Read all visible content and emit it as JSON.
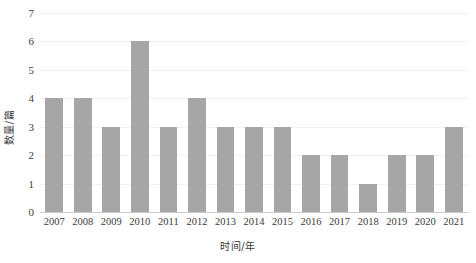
{
  "chart_data": {
    "type": "bar",
    "title": "",
    "xlabel": "时间/年",
    "ylabel": "数量/篇",
    "categories": [
      "2007",
      "2008",
      "2009",
      "2010",
      "2011",
      "2012",
      "2013",
      "2014",
      "2015",
      "2016",
      "2017",
      "2018",
      "2019",
      "2020",
      "2021"
    ],
    "values": [
      4,
      4,
      3,
      6,
      3,
      4,
      3,
      3,
      3,
      2,
      2,
      1,
      2,
      2,
      3
    ],
    "series": [
      {
        "name": "数量/篇",
        "values": [
          4,
          4,
          3,
          6,
          3,
          4,
          3,
          3,
          3,
          2,
          2,
          1,
          2,
          2,
          3
        ]
      }
    ],
    "ylim": [
      0,
      7
    ],
    "xlim_categories": 15,
    "y_ticks": [
      0,
      1,
      2,
      3,
      4,
      5,
      6,
      7
    ],
    "y_tick_labels": [
      "0",
      "1",
      "2",
      "3",
      "4",
      "5",
      "6",
      "7"
    ],
    "grid": true,
    "grid_axis": "y",
    "legend": false,
    "legend_position": "none",
    "bar_color": "#a6a6a6",
    "gridline_color": "#f1f1f1",
    "axis_line_color": "#c9c9c9",
    "background_color": "#ffffff",
    "text_color": "#3c3c3c"
  }
}
